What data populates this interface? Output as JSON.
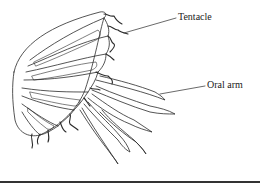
{
  "diagram": {
    "labels": [
      {
        "id": "tentacle",
        "text": "Tentacle"
      },
      {
        "id": "oral-arm",
        "text": "Oral arm"
      }
    ],
    "colors": {
      "line": "#2a2a2a",
      "background": "#ffffff",
      "rule": "#333333"
    }
  }
}
